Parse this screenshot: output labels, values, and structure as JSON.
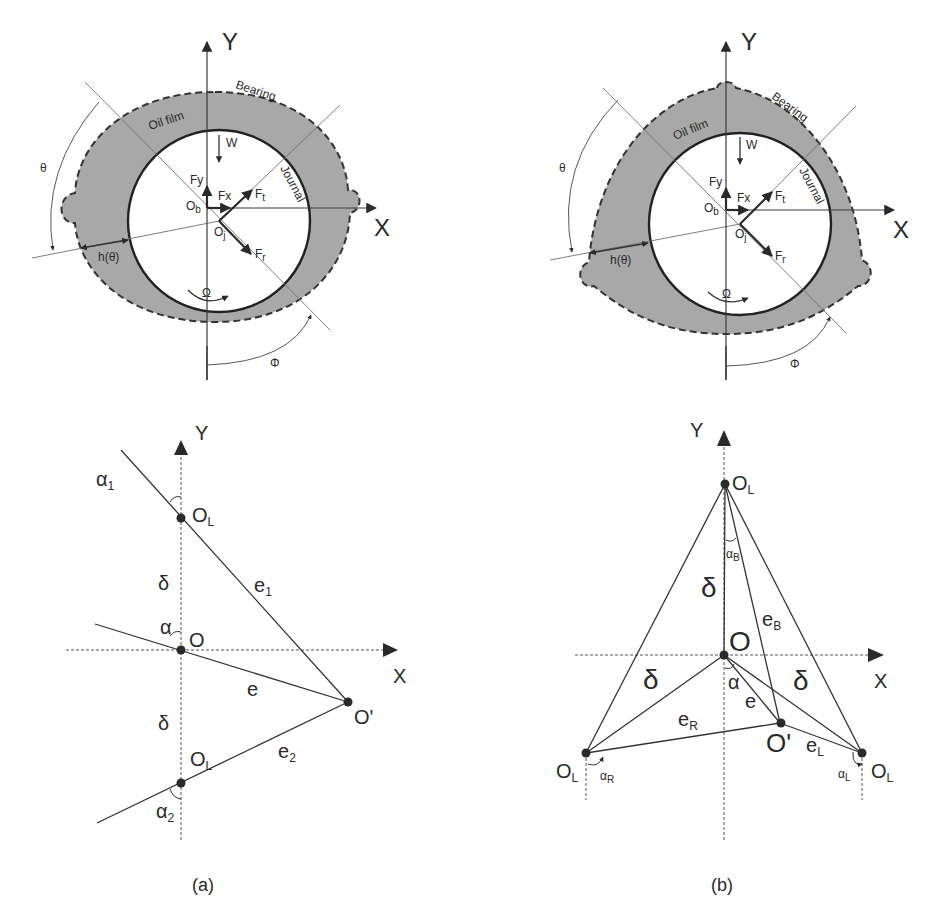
{
  "figure": {
    "panels": [
      {
        "id": "a",
        "caption": "(a)",
        "bearing_diagram": {
          "type": "two-lobe (elliptical) journal bearing",
          "axis_x": "X",
          "axis_y": "Y",
          "labels": {
            "bearing": "Bearing",
            "oil_film": "Oil film",
            "journal": "Journal",
            "load": "W",
            "force_y": "Fy",
            "force_x": "Fx",
            "force_t": "F",
            "force_t_sub": "t",
            "force_r": "F",
            "force_r_sub": "r",
            "bearing_center": "O",
            "bearing_center_sub": "b",
            "journal_center": "O",
            "journal_center_sub": "j",
            "theta": "θ",
            "film_thickness": "h(θ)",
            "rotation": "Ω",
            "attitude_angle": "Φ"
          }
        },
        "geometry_diagram": {
          "axis_x": "X",
          "axis_y": "Y",
          "labels": {
            "lobe_center_top": "O",
            "lobe_center_top_sub": "L",
            "lobe_center_bottom": "O",
            "lobe_center_bottom_sub": "L",
            "origin": "O",
            "journal_center": "O'",
            "preload_top": "δ",
            "preload_bottom": "δ",
            "ecc": "e",
            "ecc1": "e",
            "ecc1_sub": "1",
            "ecc2": "e",
            "ecc2_sub": "2",
            "alpha": "α",
            "alpha1": "α",
            "alpha1_sub": "1",
            "alpha2": "α",
            "alpha2_sub": "2"
          }
        }
      },
      {
        "id": "b",
        "caption": "(b)",
        "bearing_diagram": {
          "type": "three-lobe journal bearing",
          "axis_x": "X",
          "axis_y": "Y",
          "labels": {
            "bearing": "Bearing",
            "oil_film": "Oil film",
            "journal": "Journal",
            "load": "W",
            "force_y": "Fy",
            "force_x": "Fx",
            "force_t": "F",
            "force_t_sub": "t",
            "force_r": "F",
            "force_r_sub": "r",
            "bearing_center": "O",
            "bearing_center_sub": "b",
            "journal_center": "O",
            "journal_center_sub": "j",
            "theta": "θ",
            "film_thickness": "h(θ)",
            "rotation": "Ω",
            "attitude_angle": "Φ"
          }
        },
        "geometry_diagram": {
          "axis_x": "X",
          "axis_y": "Y",
          "labels": {
            "lobe_center_top": "O",
            "lobe_center_top_sub": "L",
            "lobe_center_left": "O",
            "lobe_center_left_sub": "L",
            "lobe_center_right": "O",
            "lobe_center_right_sub": "L",
            "origin": "O",
            "journal_center": "O'",
            "preload_top": "δ",
            "preload_left": "δ",
            "preload_right": "δ",
            "ecc": "e",
            "eccB": "e",
            "eccB_sub": "B",
            "eccR": "e",
            "eccR_sub": "R",
            "eccL": "e",
            "eccL_sub": "L",
            "alpha": "α",
            "alphaB": "α",
            "alphaB_sub": "B",
            "alphaR": "α",
            "alphaR_sub": "R",
            "alphaL": "α",
            "alphaL_sub": "L"
          }
        }
      }
    ],
    "colors": {
      "oil_film_fill": "#a8a8a8",
      "line": "#333333",
      "background": "#ffffff"
    }
  }
}
